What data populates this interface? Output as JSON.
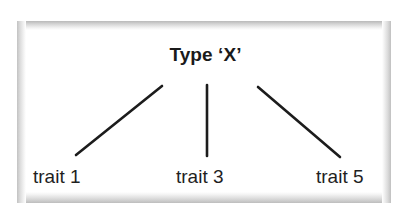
{
  "diagram": {
    "type": "tree",
    "root": {
      "id": "type-x",
      "label": "Type ‘X’"
    },
    "leaves": [
      {
        "id": "trait-1",
        "label": "trait 1"
      },
      {
        "id": "trait-3",
        "label": "trait 3"
      },
      {
        "id": "trait-5",
        "label": "trait 5"
      }
    ],
    "edges": [
      {
        "from": "type-x",
        "to": "trait-1",
        "x1": 162,
        "y1": 86,
        "x2": 76,
        "y2": 155
      },
      {
        "from": "type-x",
        "to": "trait-3",
        "x1": 207,
        "y1": 85,
        "x2": 207,
        "y2": 156
      },
      {
        "from": "type-x",
        "to": "trait-5",
        "x1": 258,
        "y1": 87,
        "x2": 340,
        "y2": 157
      }
    ],
    "colors": {
      "line": "#1c1c1c",
      "text": "#1a1a1a",
      "panel_background": "#ffffff",
      "panel_border": "#c0c0c0",
      "page_background": "#ffffff"
    }
  }
}
